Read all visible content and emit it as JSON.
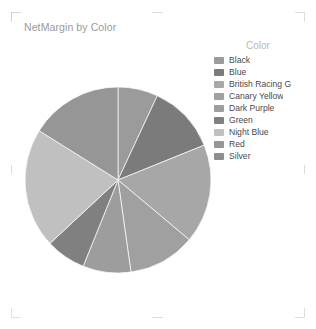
{
  "visual": {
    "title": "NetMargin by Color",
    "background": "#ffffff",
    "title_color": "#9a9a9a"
  },
  "legend": {
    "title": "Color",
    "position": "right",
    "items": [
      {
        "label": "Black",
        "color": "#9b9b9b"
      },
      {
        "label": "Blue",
        "color": "#7b7b7b"
      },
      {
        "label": "British Racing G",
        "color": "#a7a7a7"
      },
      {
        "label": "Canary Yellow",
        "color": "#a0a0a0"
      },
      {
        "label": "Dark Purple",
        "color": "#9d9d9d"
      },
      {
        "label": "Green",
        "color": "#808080"
      },
      {
        "label": "Night Blue",
        "color": "#c0c0c0"
      },
      {
        "label": "Red",
        "color": "#969696"
      },
      {
        "label": "Silver",
        "color": "#8d8d8d"
      }
    ]
  },
  "chart_data": {
    "type": "pie",
    "title": "NetMargin by Color",
    "xlabel": "",
    "ylabel": "",
    "legend_title": "Color",
    "legend_position": "right",
    "grid": false,
    "start_angle_deg": 0,
    "direction": "clockwise",
    "center": {
      "x": 118,
      "y": 180
    },
    "radius": 93,
    "categories": [
      "Black",
      "Blue",
      "British Racing G",
      "Canary Yellow",
      "Dark Purple",
      "Green",
      "Night Blue",
      "Red",
      "Silver"
    ],
    "values": [
      25,
      43,
      62,
      42,
      30,
      25,
      75,
      58,
      0
    ],
    "angles_deg": [
      25,
      43,
      62,
      42,
      30,
      25,
      75,
      58,
      0
    ],
    "percentages": [
      6.9,
      11.9,
      17.2,
      11.7,
      8.3,
      6.9,
      20.8,
      16.1,
      0.0
    ],
    "colors": [
      "#9b9b9b",
      "#7b7b7b",
      "#a7a7a7",
      "#a0a0a0",
      "#9d9d9d",
      "#808080",
      "#c0c0c0",
      "#969696",
      "#8d8d8d"
    ],
    "slices": [
      {
        "label": "Black",
        "angle_deg": 25,
        "percentage": 6.9,
        "color": "#9b9b9b"
      },
      {
        "label": "Blue",
        "angle_deg": 43,
        "percentage": 11.9,
        "color": "#7b7b7b"
      },
      {
        "label": "British Racing G",
        "angle_deg": 62,
        "percentage": 17.2,
        "color": "#a7a7a7"
      },
      {
        "label": "Canary Yellow",
        "angle_deg": 42,
        "percentage": 11.7,
        "color": "#a0a0a0"
      },
      {
        "label": "Dark Purple",
        "angle_deg": 30,
        "percentage": 8.3,
        "color": "#9d9d9d"
      },
      {
        "label": "Green",
        "angle_deg": 25,
        "percentage": 6.9,
        "color": "#808080"
      },
      {
        "label": "Night Blue",
        "angle_deg": 75,
        "percentage": 20.8,
        "color": "#c0c0c0"
      },
      {
        "label": "Red",
        "angle_deg": 58,
        "percentage": 16.1,
        "color": "#969696"
      }
    ]
  }
}
